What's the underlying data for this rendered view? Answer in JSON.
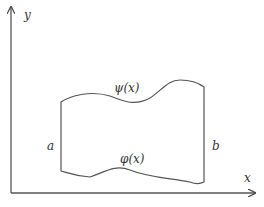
{
  "diagram": {
    "type": "region-between-curves",
    "axes": {
      "x_label": "x",
      "y_label": "y"
    },
    "upper_curve_label": "ψ(x)",
    "lower_curve_label": "φ(x)",
    "left_bound_label": "a",
    "right_bound_label": "b",
    "colors": {
      "stroke": "#555555",
      "text": "#333333",
      "background": "#ffffff"
    }
  }
}
